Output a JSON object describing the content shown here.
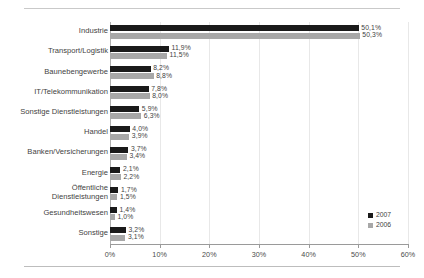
{
  "chart_data": {
    "type": "bar",
    "orientation": "horizontal",
    "title": "",
    "subtitle": "",
    "xlabel": "",
    "ylabel": "",
    "xlim": [
      0,
      60
    ],
    "xticks": [
      0,
      10,
      20,
      30,
      40,
      50,
      60
    ],
    "xticklabels": [
      "0%",
      "10%",
      "20%",
      "30%",
      "40%",
      "50%",
      "60%"
    ],
    "grid": true,
    "legend_position": "bottom-right",
    "value_label_suffix": "%",
    "decimal_separator": ",",
    "categories": [
      "Industrie",
      "Transport/Logistik",
      "Baunebengewerbe",
      "IT/Telekommunikation",
      "Sonstige Dienstleistungen",
      "Handel",
      "Banken/Versicherungen",
      "Energie",
      "Öffentliche\nDienstleistungen",
      "Gesundheitswesen",
      "Sonstige"
    ],
    "series": [
      {
        "name": "2007",
        "color": "#1a1a1a",
        "values": [
          50.1,
          11.9,
          8.2,
          7.8,
          5.9,
          4.0,
          3.7,
          2.1,
          1.7,
          1.4,
          3.2
        ],
        "labels": [
          "50,1%",
          "11,9%",
          "8,2%",
          "7,8%",
          "5,9%",
          "4,0%",
          "3,7%",
          "2,1%",
          "1,7%",
          "1,4%",
          "3,2%"
        ]
      },
      {
        "name": "2006",
        "color": "#a8a8a8",
        "values": [
          50.3,
          11.5,
          8.8,
          8.0,
          6.3,
          3.9,
          3.4,
          2.2,
          1.5,
          1.0,
          3.1
        ],
        "labels": [
          "50,3%",
          "11,5%",
          "8,8%",
          "8,0%",
          "6,3%",
          "3,9%",
          "3,4%",
          "2,2%",
          "1,5%",
          "1,0%",
          "3,1%"
        ]
      }
    ],
    "legend": [
      {
        "label": "2007",
        "color": "#1a1a1a"
      },
      {
        "label": "2006",
        "color": "#a8a8a8"
      }
    ]
  }
}
